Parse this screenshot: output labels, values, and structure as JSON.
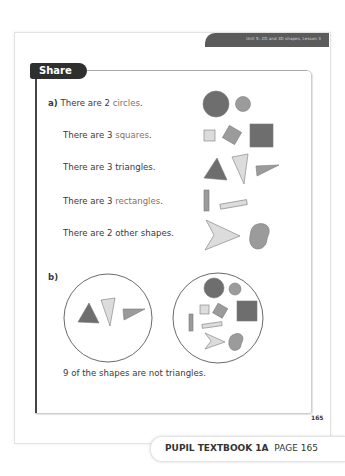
{
  "header": {
    "unit": "Unit 5: 2D and 3D shapes, Lesson 3"
  },
  "section": {
    "title": "Share"
  },
  "part_a": {
    "label": "a)",
    "lines": [
      {
        "prefix": "There are 2 ",
        "word": "circles",
        "suffix": ".",
        "accent": true
      },
      {
        "prefix": "There are 3 ",
        "word": "squares",
        "suffix": ".",
        "accent": true
      },
      {
        "prefix": "There are 3 ",
        "word": "triangles",
        "suffix": ".",
        "accent": false
      },
      {
        "prefix": "There are 3 ",
        "word": "rectangles",
        "suffix": ".",
        "accent": true
      },
      {
        "prefix": "There are 2 ",
        "word": "other shapes",
        "suffix": ".",
        "accent": false
      }
    ]
  },
  "part_b": {
    "label": "b)",
    "sentence": "9 of the shapes are not triangles."
  },
  "page_number": "165",
  "footer": {
    "book": "PUPIL TEXTBOOK 1A",
    "page": "PAGE 165"
  },
  "colors": {
    "dark_shape": "#6e6e6e",
    "mid_shape": "#9b9b9b",
    "light_shape": "#dcdcdc",
    "accent_text": "#8a6f65",
    "tab": "#2f2f2f"
  }
}
